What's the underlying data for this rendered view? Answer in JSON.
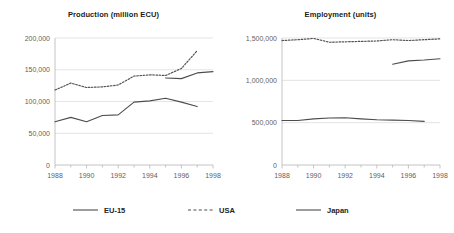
{
  "chart_data": [
    {
      "type": "line",
      "title": "Production (million ECU)",
      "xlabel": "",
      "ylabel": "",
      "xlim": [
        1988,
        1998
      ],
      "ylim": [
        0,
        200000
      ],
      "ytick_labels": [
        "0",
        "50,000",
        "100,000",
        "150,000",
        "200,000"
      ],
      "ytick_values": [
        0,
        50000,
        100000,
        150000,
        200000
      ],
      "xtick_labels": [
        "1988",
        "1990",
        "1992",
        "1994",
        "1996",
        "1998"
      ],
      "xtick_values": [
        1988,
        1990,
        1992,
        1994,
        1996,
        1998
      ],
      "minor_xticks": [
        1989,
        1991,
        1993,
        1995,
        1997
      ],
      "grid": "horizontal",
      "legend_position": "bottom-shared",
      "series": [
        {
          "name": "EU-15",
          "style": "solid",
          "color": "#4d4d4d",
          "x": [
            1995,
            1996,
            1997,
            1998
          ],
          "values": [
            137000,
            136000,
            145000,
            147000
          ]
        },
        {
          "name": "USA",
          "style": "dotted",
          "color": "#555555",
          "x": [
            1988,
            1989,
            1990,
            1991,
            1992,
            1993,
            1994,
            1995,
            1996,
            1997
          ],
          "values": [
            118000,
            129000,
            122000,
            123000,
            126000,
            140000,
            142000,
            141000,
            152000,
            180000
          ]
        },
        {
          "name": "Japan",
          "style": "solid",
          "color": "#4d4d4d",
          "x": [
            1988,
            1989,
            1990,
            1991,
            1992,
            1993,
            1994,
            1995,
            1996,
            1997
          ],
          "values": [
            68000,
            75000,
            68000,
            78000,
            79000,
            99000,
            101000,
            105000,
            99000,
            92000
          ]
        }
      ]
    },
    {
      "type": "line",
      "title": "Employment (units)",
      "xlabel": "",
      "ylabel": "",
      "xlim": [
        1988,
        1998
      ],
      "ylim": [
        0,
        1500000
      ],
      "ytick_labels": [
        "0",
        "500,000",
        "1,000,000",
        "1,500,000"
      ],
      "ytick_values": [
        0,
        500000,
        1000000,
        1500000
      ],
      "xtick_labels": [
        "1988",
        "1990",
        "1992",
        "1994",
        "1996",
        "1998"
      ],
      "xtick_values": [
        1988,
        1990,
        1992,
        1994,
        1996,
        1998
      ],
      "minor_xticks": [
        1989,
        1991,
        1993,
        1995,
        1997
      ],
      "grid": "horizontal",
      "legend_position": "bottom-shared",
      "series": [
        {
          "name": "EU-15",
          "style": "solid",
          "color": "#4d4d4d",
          "x": [
            1995,
            1996,
            1997,
            1998
          ],
          "values": [
            1190000,
            1230000,
            1240000,
            1255000
          ]
        },
        {
          "name": "USA",
          "style": "dotted",
          "color": "#555555",
          "x": [
            1988,
            1989,
            1990,
            1991,
            1992,
            1993,
            1994,
            1995,
            1996,
            1997,
            1998
          ],
          "values": [
            1470000,
            1480000,
            1495000,
            1450000,
            1455000,
            1460000,
            1465000,
            1480000,
            1470000,
            1480000,
            1490000
          ]
        },
        {
          "name": "Japan",
          "style": "solid",
          "color": "#4d4d4d",
          "x": [
            1988,
            1989,
            1990,
            1991,
            1992,
            1993,
            1994,
            1995,
            1996,
            1997
          ],
          "values": [
            525000,
            525000,
            545000,
            555000,
            558000,
            545000,
            535000,
            530000,
            525000,
            515000
          ]
        }
      ]
    }
  ],
  "legend": {
    "items": [
      {
        "label": "EU-15",
        "style": "solid"
      },
      {
        "label": "USA",
        "style": "dotted"
      },
      {
        "label": "Japan",
        "style": "solid"
      }
    ]
  },
  "colors": {
    "axis": "#b5b5b5",
    "grid": "#d9d9d9",
    "line": "#4d4d4d",
    "text": "#5f5f5f",
    "title": "#1a1a1a",
    "background": "#ffffff"
  }
}
